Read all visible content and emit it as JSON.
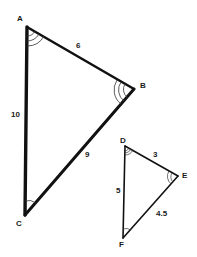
{
  "diagram": {
    "type": "similar-triangles",
    "stroke_color": "#111111",
    "triangle_large": {
      "name": "ABC",
      "vertices": {
        "A": {
          "label": "A",
          "x": 27,
          "y": 27
        },
        "B": {
          "label": "B",
          "x": 134,
          "y": 89
        },
        "C": {
          "label": "C",
          "x": 25,
          "y": 215
        }
      },
      "sides": {
        "AB": "6",
        "AC": "10",
        "BC": "9"
      },
      "angle_marks": {
        "A": 3,
        "B": 3,
        "C": 1
      }
    },
    "triangle_small": {
      "name": "DEF",
      "vertices": {
        "D": {
          "label": "D",
          "x": 125,
          "y": 146
        },
        "E": {
          "label": "E",
          "x": 178,
          "y": 176
        },
        "F": {
          "label": "F",
          "x": 123,
          "y": 238
        }
      },
      "sides": {
        "DE": "3",
        "DF": "5",
        "EF": "4.5"
      },
      "angle_marks": {
        "D": 3,
        "E": 2,
        "F": 1
      }
    }
  }
}
